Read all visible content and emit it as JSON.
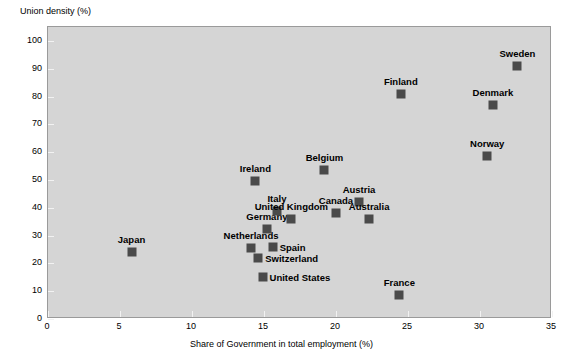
{
  "chart_data": {
    "type": "scatter",
    "title": "",
    "xlabel": "Share of Government in total employment (%)",
    "ylabel": "Union density (%)",
    "xlim": [
      0,
      35
    ],
    "ylim": [
      0,
      105
    ],
    "xticks": [
      0,
      5,
      10,
      15,
      20,
      25,
      30,
      35
    ],
    "yticks": [
      0,
      10,
      20,
      30,
      40,
      50,
      60,
      70,
      80,
      90,
      100
    ],
    "grid": false,
    "legend": "none",
    "marker_color": "#4a4a4a",
    "plot_background": "#d5d5d5",
    "points": [
      {
        "label": "Japan",
        "x": 5.8,
        "y": 24.0,
        "label_pos": "above"
      },
      {
        "label": "Netherlands",
        "x": 14.1,
        "y": 25.5,
        "label_pos": "above"
      },
      {
        "label": "Ireland",
        "x": 14.4,
        "y": 49.5,
        "label_pos": "above"
      },
      {
        "label": "Switzerland",
        "x": 14.6,
        "y": 22.0,
        "label_pos": "right"
      },
      {
        "label": "United States",
        "x": 14.9,
        "y": 15.0,
        "label_pos": "right"
      },
      {
        "label": "Germany",
        "x": 15.2,
        "y": 32.5,
        "label_pos": "above"
      },
      {
        "label": "Spain",
        "x": 15.6,
        "y": 26.0,
        "label_pos": "right"
      },
      {
        "label": "Italy",
        "x": 15.9,
        "y": 39.0,
        "label_pos": "above"
      },
      {
        "label": "United Kingdom",
        "x": 16.9,
        "y": 36.0,
        "label_pos": "above"
      },
      {
        "label": "Belgium",
        "x": 19.2,
        "y": 53.5,
        "label_pos": "above"
      },
      {
        "label": "Canada",
        "x": 20.0,
        "y": 38.0,
        "label_pos": "above"
      },
      {
        "label": "Austria",
        "x": 21.6,
        "y": 42.0,
        "label_pos": "above"
      },
      {
        "label": "Australia",
        "x": 22.3,
        "y": 36.0,
        "label_pos": "above"
      },
      {
        "label": "France",
        "x": 24.4,
        "y": 8.6,
        "label_pos": "above"
      },
      {
        "label": "Finland",
        "x": 24.5,
        "y": 81.0,
        "label_pos": "above"
      },
      {
        "label": "Norway",
        "x": 30.5,
        "y": 58.5,
        "label_pos": "above"
      },
      {
        "label": "Denmark",
        "x": 30.9,
        "y": 77.0,
        "label_pos": "above"
      },
      {
        "label": "Sweden",
        "x": 32.6,
        "y": 91.0,
        "label_pos": "above"
      }
    ]
  }
}
